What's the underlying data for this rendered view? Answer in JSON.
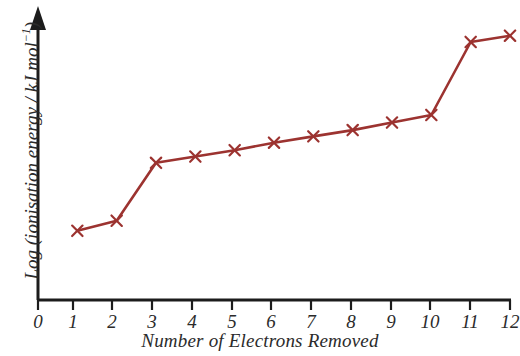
{
  "chart_data": {
    "type": "line",
    "title": "",
    "xlabel": "Number of Electrons Removed",
    "ylabel": "Log (ionisation energy / kJ mol⁻¹)",
    "ylabel_base": "Log (ionisation energy / kJ mol",
    "ylabel_sup": "−1",
    "ylabel_tail": ")",
    "x": [
      1,
      2,
      3,
      4,
      5,
      6,
      7,
      8,
      9,
      10,
      11,
      12
    ],
    "values": [
      0.55,
      0.63,
      1.09,
      1.14,
      1.19,
      1.25,
      1.3,
      1.35,
      1.41,
      1.47,
      2.05,
      2.1
    ],
    "xlim": [
      0,
      12
    ],
    "ylim": [
      0,
      2.32
    ],
    "xticks": [
      "0",
      "1",
      "2",
      "3",
      "4",
      "5",
      "6",
      "7",
      "8",
      "9",
      "10",
      "11",
      "12"
    ],
    "yticks": [],
    "grid": false,
    "legend": false,
    "marker": "x",
    "series_color": "#9c3330",
    "axis_color": "#1c1c1c",
    "text_color": "#2b2b2b",
    "background": "#ffffff",
    "annotations": [
      "Large jump in log ionisation energy between the 2nd and 3rd electron removed",
      "Large jump in log ionisation energy between the 10th and 11th electron removed"
    ]
  }
}
